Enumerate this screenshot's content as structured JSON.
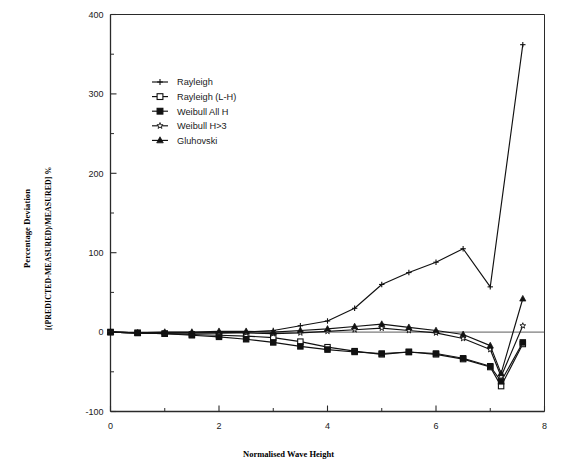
{
  "axes": {
    "x_title": "Normalised Wave Height",
    "y_title_main": "Percentage Deviation",
    "y_title_sub": "[(PREDICTED-MEASURED)/MEASURED] %",
    "x_ticks": [
      "0",
      "2",
      "4",
      "6",
      "8"
    ],
    "y_ticks": [
      "400",
      "300",
      "200",
      "100",
      "0",
      "-100"
    ]
  },
  "legend": {
    "items": [
      {
        "label": "Rayleigh",
        "marker": "plus"
      },
      {
        "label": "Rayleigh (L-H)",
        "marker": "open-square"
      },
      {
        "label": "Weibull All H",
        "marker": "filled-square"
      },
      {
        "label": "Weibull H>3",
        "marker": "open-star"
      },
      {
        "label": "Gluhovski",
        "marker": "filled-triangle"
      }
    ]
  },
  "chart_data": {
    "type": "line",
    "title": "",
    "xlabel": "Normalised Wave Height",
    "ylabel": "Percentage Deviation [(PREDICTED-MEASURED)/MEASURED] %",
    "xlim": [
      0,
      8
    ],
    "ylim": [
      -100,
      400
    ],
    "xticks": [
      0,
      2,
      4,
      6,
      8
    ],
    "xminorticks": [
      1,
      3,
      5,
      7
    ],
    "yticks": [
      -100,
      0,
      100,
      200,
      300,
      400
    ],
    "yminorticks": [
      -50,
      50,
      150,
      250,
      350
    ],
    "grid": false,
    "legend_position": "upper-left-inset",
    "zero_line": true,
    "series": [
      {
        "name": "Rayleigh",
        "marker": "plus",
        "x": [
          0,
          0.5,
          1.0,
          1.5,
          2.0,
          2.5,
          3.0,
          3.5,
          4.0,
          4.5,
          5.0,
          5.5,
          6.0,
          6.5,
          7.0,
          7.6
        ],
        "y": [
          0,
          -1,
          -1,
          -1,
          -1,
          0,
          2,
          8,
          14,
          30,
          60,
          75,
          88,
          105,
          57,
          362
        ]
      },
      {
        "name": "Rayleigh (L-H)",
        "marker": "open-square",
        "x": [
          0,
          0.5,
          1.0,
          1.5,
          2.0,
          2.5,
          3.0,
          3.5,
          4.0,
          4.5,
          5.0,
          5.5,
          6.0,
          6.5,
          7.0,
          7.2,
          7.6
        ],
        "y": [
          0,
          -1,
          -2,
          -3,
          -4,
          -5,
          -7,
          -12,
          -19,
          -24,
          -28,
          -25,
          -28,
          -34,
          -44,
          -68,
          -15
        ]
      },
      {
        "name": "Weibull All H",
        "marker": "filled-square",
        "x": [
          0,
          0.5,
          1.0,
          1.5,
          2.0,
          2.5,
          3.0,
          3.5,
          4.0,
          4.5,
          5.0,
          5.5,
          6.0,
          6.5,
          7.0,
          7.2,
          7.6
        ],
        "y": [
          0,
          -1,
          -2,
          -4,
          -6,
          -9,
          -13,
          -18,
          -22,
          -25,
          -27,
          -25,
          -27,
          -33,
          -43,
          -62,
          -13
        ]
      },
      {
        "name": "Weibull H>3",
        "marker": "open-star",
        "x": [
          0,
          0.5,
          1.0,
          1.5,
          2.0,
          2.5,
          3.0,
          3.5,
          4.0,
          4.5,
          5.0,
          5.5,
          6.0,
          6.5,
          7.0,
          7.2,
          7.6
        ],
        "y": [
          0,
          -1,
          -1,
          -1,
          -1,
          -1,
          -2,
          -1,
          1,
          3,
          5,
          2,
          -1,
          -8,
          -22,
          -56,
          8
        ]
      },
      {
        "name": "Gluhovski",
        "marker": "filled-triangle",
        "x": [
          0,
          0.5,
          1.0,
          1.5,
          2.0,
          2.5,
          3.0,
          3.5,
          4.0,
          4.5,
          5.0,
          5.5,
          6.0,
          6.5,
          7.0,
          7.2,
          7.6
        ],
        "y": [
          0,
          -1,
          0,
          0,
          1,
          1,
          0,
          2,
          4,
          7,
          10,
          6,
          2,
          -3,
          -17,
          -52,
          42
        ]
      }
    ]
  }
}
